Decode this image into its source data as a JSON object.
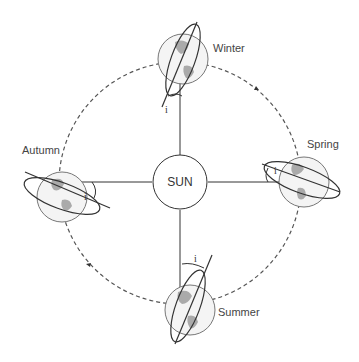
{
  "diagram": {
    "sun_label": "SUN",
    "seasons": [
      {
        "name": "Winter",
        "position": "top"
      },
      {
        "name": "Spring",
        "position": "right"
      },
      {
        "name": "Summer",
        "position": "bottom"
      },
      {
        "name": "Autumn",
        "position": "left"
      }
    ],
    "tilt_label": "i",
    "colors": {
      "line": "#333333",
      "orbit": "#555555",
      "land": "#aaaaaa",
      "globe_edge": "#777777"
    }
  }
}
